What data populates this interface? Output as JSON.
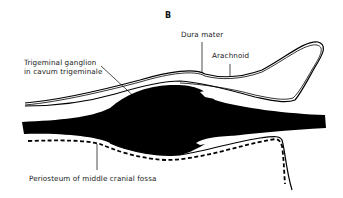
{
  "figure": {
    "panel_label": "B",
    "labels": {
      "dura_mater": "Dura mater",
      "arachnoid": "Arachnoid",
      "ganglion_line1": "Trigeminal ganglion",
      "ganglion_line2": "in cavum trigeminale",
      "periosteum": "Periosteum of middle cranial fossa"
    },
    "colors": {
      "background": "#ffffff",
      "ink": "#000000",
      "text": "#222222"
    }
  }
}
